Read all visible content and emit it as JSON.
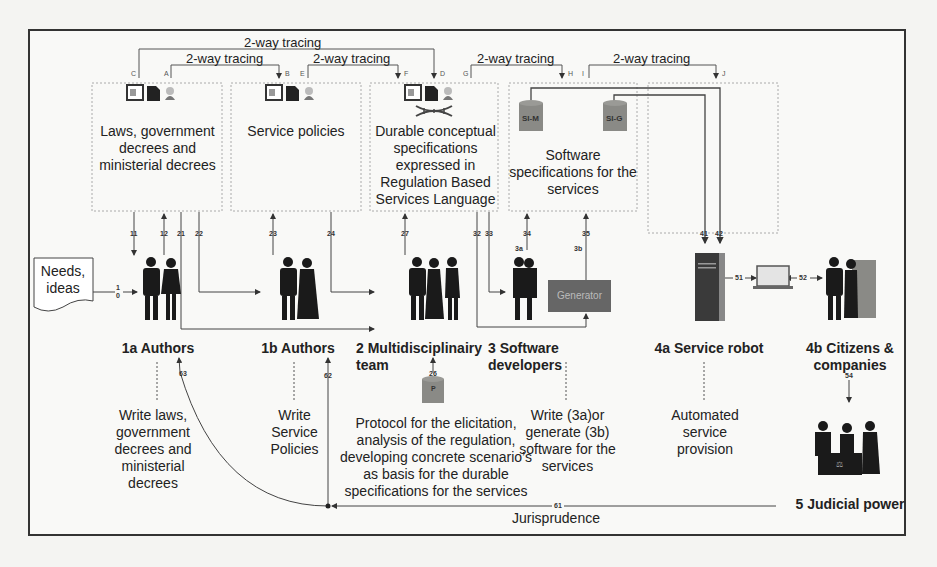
{
  "tracing": {
    "label": "2-way tracing",
    "letters": [
      "C",
      "A",
      "B",
      "E",
      "F",
      "D",
      "G",
      "H",
      "I",
      "J"
    ]
  },
  "boxes": {
    "laws": "Laws, government decrees and ministerial decrees",
    "laws_lines": [
      "Laws, government",
      "decrees and",
      "ministerial decrees"
    ],
    "policies": "Service policies",
    "durable_lines": [
      "Durable conceptual",
      "specifications",
      "expressed in",
      "Regulation Based",
      "Services Language"
    ],
    "software_lines": [
      "Software",
      "specifications for the",
      "services"
    ],
    "db_sim": "SI-M",
    "db_sig": "SI-G"
  },
  "needs": {
    "lines": [
      "Needs,",
      "ideas"
    ],
    "arrow_num_top": "1",
    "arrow_num_bottom": "0"
  },
  "actors": {
    "authors_1a": "1a Authors",
    "authors_1b": "1b Authors",
    "team_2": "2 Multidisciplinairy team",
    "devs_3": "3 Software developers",
    "robot_4a": "4a Service robot",
    "citizens_4b_lines": [
      "4b Citizens &",
      "companies"
    ],
    "judicial_5": "5 Judicial power",
    "generator": "Generator",
    "tag_3a": "3a",
    "tag_3b": "3b",
    "protocol_db": "P"
  },
  "activities": {
    "write_laws_lines": [
      "Write laws,",
      "government",
      "decrees and",
      "ministerial",
      "decrees"
    ],
    "write_policies_lines": [
      "Write",
      "Service",
      "Policies"
    ],
    "protocol_lines": [
      "Protocol for the elicitation,",
      "analysis of the regulation,",
      "developing concrete scenario’s",
      "as basis for the durable",
      "specifications for the services"
    ],
    "write_software_lines": [
      "Write (3a)or",
      "generate (3b)",
      "software for the",
      "services"
    ],
    "automated_lines": [
      "Automated",
      "service",
      "provision"
    ],
    "jurisprudence": "Jurisprudence"
  },
  "flow_numbers": [
    "11",
    "12",
    "21",
    "22",
    "23",
    "24",
    "27",
    "32",
    "33",
    "34",
    "35",
    "41",
    "42",
    "51",
    "52",
    "54",
    "26",
    "61",
    "62",
    "63"
  ],
  "colors": {
    "frame": "#333333",
    "dotted": "#9a9a9a",
    "db_fill": "#8a8a86",
    "generator_fill": "#666666",
    "silhouette": "#1a1a1a"
  }
}
